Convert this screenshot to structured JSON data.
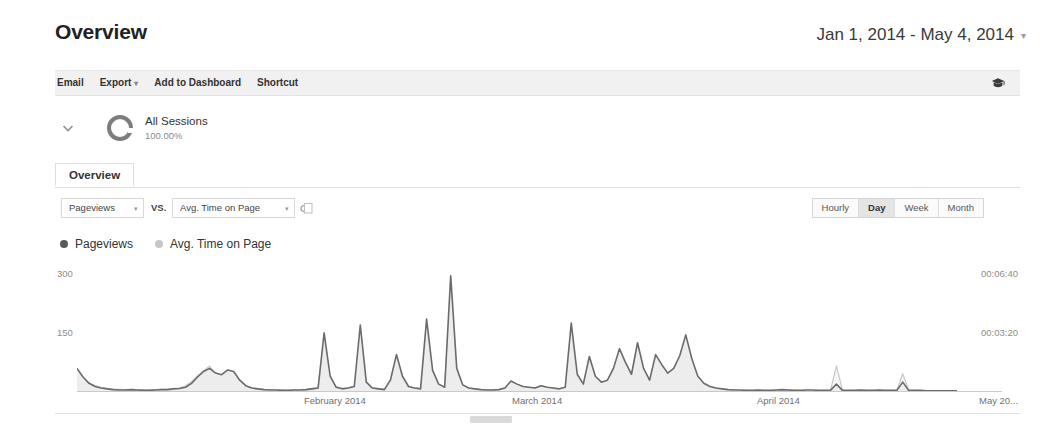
{
  "header": {
    "title": "Overview",
    "date_range": "Jan 1, 2014 - May 4, 2014",
    "date_caret": "▾"
  },
  "toolbar": {
    "items": [
      {
        "label": "Email",
        "caret": ""
      },
      {
        "label": "Export",
        "caret": "▾"
      },
      {
        "label": "Add to Dashboard",
        "caret": ""
      },
      {
        "label": "Shortcut",
        "caret": ""
      }
    ],
    "help_icon": "graduation-cap-icon"
  },
  "segment": {
    "expand_icon": "chevron-down-icon",
    "donut_icon": "segment-donut-icon",
    "name": "All Sessions",
    "percent": "100.00%"
  },
  "tabs": [
    {
      "label": "Overview",
      "active": true
    }
  ],
  "metric_selectors": {
    "primary": {
      "label": "Pageviews",
      "caret": "▾"
    },
    "vs_label": "VS.",
    "secondary": {
      "label": "Avg. Time on Page",
      "caret": "▾"
    },
    "extra_icon": "select-metric-icon"
  },
  "granularity": {
    "options": [
      "Hourly",
      "Day",
      "Week",
      "Month"
    ],
    "selected": "Day"
  },
  "legend": [
    {
      "label": "Pageviews",
      "color": "#5a5a5a"
    },
    {
      "label": "Avg. Time on Page",
      "color": "#c6c6c6"
    }
  ],
  "colors": {
    "pageviews_line": "#6b6b6b",
    "pageviews_fill": "#eaeaea",
    "avgtime_line": "#c9c9c9",
    "avgtime_fill": "#f4f4f4",
    "axis": "#c9c9c9",
    "toolbar_bg": "#f1f1f1"
  },
  "chart_data": {
    "type": "line",
    "title": "",
    "xlabel": "",
    "ylabel": "Pageviews",
    "y2label": "Avg. Time on Page",
    "grid": false,
    "legend_position": "top-left",
    "x_ticks": [
      {
        "label": "February 2014",
        "pos": 0.245
      },
      {
        "label": "March 2014",
        "pos": 0.47
      },
      {
        "label": "April 2014",
        "pos": 0.735
      },
      {
        "label": "May 20...",
        "pos": 0.975
      }
    ],
    "y_left": {
      "ticks": [
        "150",
        "300"
      ],
      "values": [
        150,
        300
      ],
      "ylim": [
        0,
        330
      ]
    },
    "y_right": {
      "ticks": [
        "00:03:20",
        "00:06:40"
      ],
      "values": [
        200,
        400
      ],
      "ylim": [
        0,
        440
      ]
    },
    "series": [
      {
        "name": "Pageviews",
        "color": "#6b6b6b",
        "fill": "#ededed",
        "values": [
          60,
          38,
          22,
          14,
          10,
          8,
          6,
          5,
          5,
          6,
          5,
          4,
          4,
          5,
          6,
          6,
          8,
          9,
          12,
          22,
          38,
          52,
          60,
          48,
          44,
          56,
          52,
          30,
          16,
          10,
          8,
          6,
          5,
          5,
          4,
          4,
          5,
          5,
          6,
          8,
          10,
          150,
          40,
          12,
          8,
          10,
          14,
          170,
          25,
          10,
          8,
          6,
          30,
          95,
          40,
          14,
          10,
          8,
          185,
          55,
          20,
          12,
          295,
          60,
          18,
          10,
          8,
          6,
          5,
          5,
          6,
          10,
          28,
          20,
          14,
          12,
          10,
          16,
          12,
          10,
          8,
          12,
          175,
          45,
          20,
          90,
          40,
          25,
          30,
          60,
          110,
          75,
          45,
          125,
          60,
          30,
          95,
          70,
          48,
          60,
          92,
          145,
          85,
          40,
          22,
          14,
          10,
          8,
          6,
          5,
          5,
          4,
          4,
          5,
          4,
          4,
          5,
          6,
          5,
          4,
          4,
          5,
          5,
          4,
          4,
          4,
          20,
          4,
          4,
          4,
          5,
          4,
          4,
          5,
          4,
          4,
          4,
          25,
          4,
          4,
          4,
          3,
          3,
          3,
          3,
          3,
          3
        ]
      },
      {
        "name": "Avg. Time on Page",
        "color": "#c9c9c9",
        "fill": "#f6f6f6",
        "values": [
          45,
          40,
          30,
          22,
          16,
          12,
          10,
          9,
          8,
          9,
          8,
          7,
          7,
          8,
          9,
          10,
          12,
          14,
          20,
          35,
          55,
          72,
          88,
          60,
          55,
          70,
          62,
          40,
          22,
          14,
          11,
          9,
          8,
          7,
          7,
          6,
          7,
          8,
          9,
          12,
          15,
          135,
          55,
          18,
          12,
          14,
          20,
          140,
          30,
          14,
          12,
          10,
          42,
          120,
          50,
          18,
          14,
          12,
          175,
          70,
          25,
          16,
          300,
          78,
          24,
          13,
          11,
          9,
          8,
          7,
          9,
          14,
          36,
          26,
          18,
          15,
          13,
          22,
          16,
          13,
          11,
          16,
          155,
          58,
          26,
          118,
          52,
          32,
          38,
          75,
          140,
          95,
          58,
          160,
          78,
          38,
          120,
          90,
          60,
          78,
          118,
          130,
          72,
          36,
          28,
          18,
          13,
          10,
          8,
          7,
          6,
          6,
          5,
          6,
          5,
          5,
          6,
          8,
          7,
          6,
          5,
          6,
          6,
          5,
          5,
          5,
          88,
          6,
          5,
          5,
          6,
          5,
          5,
          6,
          5,
          5,
          5,
          62,
          5,
          5,
          5,
          4,
          4,
          4,
          4,
          4,
          4
        ]
      }
    ]
  }
}
